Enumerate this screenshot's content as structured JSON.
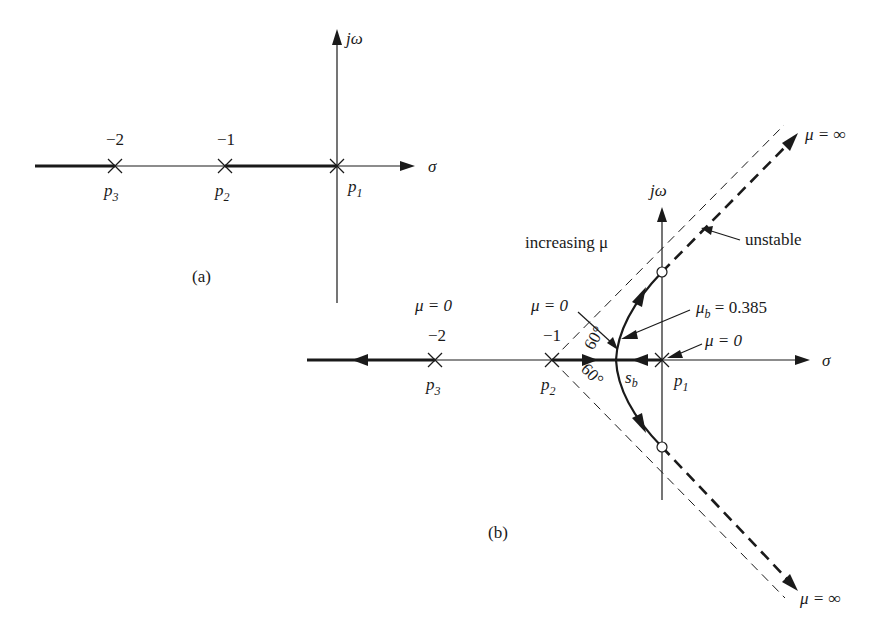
{
  "figure_a": {
    "caption": "(a)",
    "axis_real_label": "σ",
    "axis_imag_label": "jω",
    "poles": [
      {
        "name": "p",
        "sub": "3",
        "value": "−2"
      },
      {
        "name": "p",
        "sub": "2",
        "value": "−1"
      },
      {
        "name": "p",
        "sub": "1",
        "value": ""
      }
    ]
  },
  "figure_b": {
    "caption": "(b)",
    "axis_real_label": "σ",
    "axis_imag_label": "jω",
    "poles": [
      {
        "name": "p",
        "sub": "3",
        "value": "−2",
        "gain": "μ = 0"
      },
      {
        "name": "p",
        "sub": "2",
        "value": "−1",
        "gain": "μ = 0"
      },
      {
        "name": "p",
        "sub": "1",
        "value": "",
        "gain": "μ = 0"
      }
    ],
    "breakaway": {
      "name": "s",
      "sub": "b"
    },
    "breakaway_gain": {
      "name": "μ",
      "sub": "b",
      "value": " = 0.385"
    },
    "annotations": {
      "increasing": "increasing μ",
      "unstable": "unstable",
      "inf_upper": "μ = ∞",
      "inf_lower": "μ = ∞",
      "angle_upper": "60°",
      "angle_lower": "60°"
    }
  }
}
